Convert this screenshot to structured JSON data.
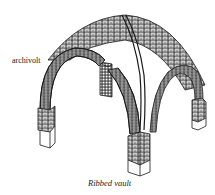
{
  "figure": {
    "title": "Ribbed vault",
    "labels": [
      {
        "text": "archivolt",
        "target": "front-left arch"
      }
    ],
    "caption": "Ribbed vault"
  },
  "colors": {
    "line": "#1a1a1a",
    "background": "#ffffff"
  }
}
